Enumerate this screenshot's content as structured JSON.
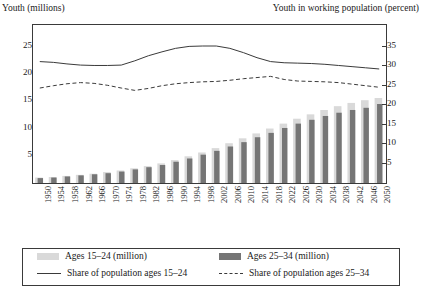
{
  "chart_data": {
    "type": "bar",
    "title": "",
    "ylabel": "Youth (millions)",
    "y2label": "Youth in working population (percent)",
    "xlabel": "",
    "ylim": [
      0,
      29
    ],
    "y2lim": [
      0,
      40.6
    ],
    "yticks": [
      5,
      10,
      15,
      20,
      25
    ],
    "y2ticks": [
      5,
      10,
      15,
      20,
      25,
      30,
      35
    ],
    "grid": false,
    "legend_position": "bottom",
    "categories": [
      1950,
      1954,
      1958,
      1962,
      1966,
      1970,
      1974,
      1978,
      1982,
      1986,
      1990,
      1994,
      1998,
      2002,
      2006,
      2010,
      2014,
      2018,
      2022,
      2026,
      2030,
      2034,
      2038,
      2042,
      2046,
      2050
    ],
    "series": [
      {
        "name": "Ages 15–24 (million)",
        "axis": "left",
        "kind": "bar",
        "color": "#d9d9d9",
        "values": [
          1.0,
          1.1,
          1.3,
          1.5,
          1.7,
          2.0,
          2.3,
          2.7,
          3.1,
          3.6,
          4.2,
          4.9,
          5.6,
          6.4,
          7.3,
          8.2,
          9.1,
          10.0,
          10.9,
          11.8,
          12.6,
          13.4,
          14.1,
          14.7,
          15.2,
          15.6
        ]
      },
      {
        "name": "Ages 25–34 (million)",
        "axis": "left",
        "kind": "bar",
        "color": "#757575",
        "values": [
          0.9,
          1.0,
          1.2,
          1.4,
          1.6,
          1.8,
          2.1,
          2.5,
          2.9,
          3.3,
          3.9,
          4.5,
          5.2,
          5.9,
          6.7,
          7.5,
          8.4,
          9.2,
          10.1,
          10.9,
          11.6,
          12.3,
          12.9,
          13.4,
          13.8,
          14.5
        ]
      },
      {
        "name": "Share of population ages 15–24",
        "axis": "right",
        "kind": "line",
        "style": "solid",
        "color": "#3a3a3a",
        "values": [
          31.2,
          31.0,
          30.6,
          30.3,
          30.2,
          30.2,
          30.3,
          31.4,
          32.7,
          33.7,
          34.6,
          35.1,
          35.2,
          35.2,
          34.6,
          33.5,
          32.2,
          31.2,
          30.9,
          30.8,
          30.7,
          30.5,
          30.2,
          29.9,
          29.6,
          29.3
        ]
      },
      {
        "name": "Share of population ages 25–34",
        "axis": "right",
        "kind": "line",
        "style": "dashed",
        "color": "#3a3a3a",
        "values": [
          24.4,
          25.0,
          25.5,
          25.8,
          25.6,
          25.1,
          24.4,
          23.8,
          24.3,
          25.0,
          25.5,
          25.8,
          26.0,
          26.1,
          26.4,
          26.8,
          27.1,
          27.4,
          26.6,
          26.2,
          26.1,
          26.0,
          25.8,
          25.4,
          25.0,
          24.6
        ]
      }
    ]
  },
  "axis_titles": {
    "left": "Youth (millions)",
    "right": "Youth in working population (percent)"
  },
  "legend": [
    {
      "label": "Ages 15–24 (million)",
      "marker": "swatch-light",
      "color": "#d9d9d9"
    },
    {
      "label": "Ages 25–34 (million)",
      "marker": "swatch-dark",
      "color": "#757575"
    },
    {
      "label": "Share of population ages 15–24",
      "marker": "line-solid",
      "color": "#3a3a3a"
    },
    {
      "label": "Share of population ages 25–34",
      "marker": "line-dashed",
      "color": "#3a3a3a"
    }
  ]
}
